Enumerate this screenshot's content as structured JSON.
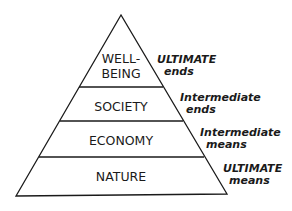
{
  "diagram": {
    "type": "pyramid",
    "levels": [
      {
        "name": "WELL-",
        "name2": "BEING",
        "label_line1": "ULTIMATE",
        "label_line2": "ends"
      },
      {
        "name": "SOCIETY",
        "label_line1": "Intermediate",
        "label_line2": "ends"
      },
      {
        "name": "ECONOMY",
        "label_line1": "Intermediate",
        "label_line2": "means"
      },
      {
        "name": "NATURE",
        "label_line1": "ULTIMATE",
        "label_line2": "means"
      }
    ],
    "colors": {
      "line": "#1a1a1a",
      "fill": "#ffffff"
    }
  }
}
